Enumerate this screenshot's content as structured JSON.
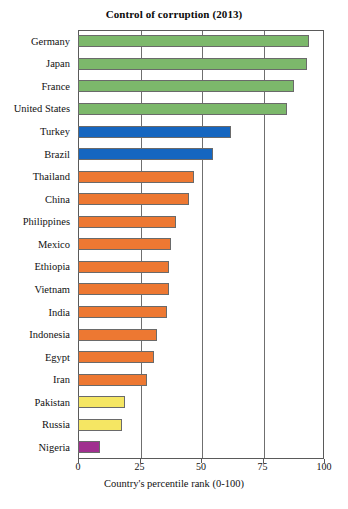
{
  "chart_data": {
    "type": "bar",
    "orientation": "horizontal",
    "title": "Control of corruption (2013)",
    "xlabel": "Country's percentile rank (0-100)",
    "ylabel": "",
    "xlim": [
      0,
      100
    ],
    "xticks": [
      0,
      25,
      50,
      75,
      100
    ],
    "grid": "vertical",
    "legend": "none",
    "categories": [
      "Germany",
      "Japan",
      "France",
      "United States",
      "Turkey",
      "Brazil",
      "Thailand",
      "China",
      "Philippines",
      "Mexico",
      "Ethiopia",
      "Vietnam",
      "India",
      "Indonesia",
      "Egypt",
      "Iran",
      "Pakistan",
      "Russia",
      "Nigeria"
    ],
    "values": [
      94,
      93,
      88,
      85,
      62,
      55,
      47,
      45,
      40,
      38,
      37,
      37,
      36,
      32,
      31,
      28,
      19,
      18,
      9
    ],
    "bar_colors": [
      "#7cb86b",
      "#7cb86b",
      "#7cb86b",
      "#7cb86b",
      "#1566c0",
      "#1566c0",
      "#ed7832",
      "#ed7832",
      "#ed7832",
      "#ed7832",
      "#ed7832",
      "#ed7832",
      "#ed7832",
      "#ed7832",
      "#ed7832",
      "#ed7832",
      "#f5e663",
      "#f5e663",
      "#a0308f"
    ]
  },
  "colors": {
    "green": "#7cb86b",
    "blue": "#1566c0",
    "orange": "#ed7832",
    "yellow": "#f5e663",
    "purple": "#a0308f",
    "axis": "#5a5a5a",
    "grid": "#6f6f6f",
    "text": "#111111",
    "background": "#ffffff"
  }
}
